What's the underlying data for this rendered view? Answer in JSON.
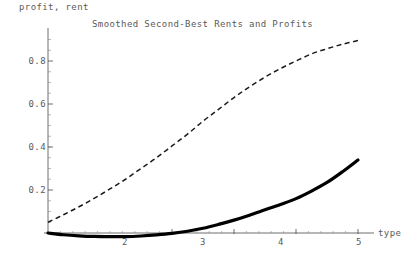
{
  "chart_data": {
    "type": "line",
    "title": "Smoothed Second-Best Rents and Profits",
    "xlabel": "type",
    "ylabel": "profit, rent",
    "xlim": [
      0,
      5.25
    ],
    "ylim": [
      -0.03,
      0.95
    ],
    "grid": false,
    "legend": "none",
    "xticks": [
      "2",
      "3",
      "4",
      "5"
    ],
    "xtick_values": [
      2,
      3,
      4,
      5
    ],
    "yticks": [
      "0.2",
      "0.4",
      "0.6",
      "0.8"
    ],
    "ytick_values": [
      0.2,
      0.4,
      0.6,
      0.8
    ],
    "series": [
      {
        "name": "rent",
        "style": "dashed",
        "color": "#1a1a1a",
        "x": [
          0,
          0.25,
          0.5,
          0.75,
          1.0,
          1.25,
          1.5,
          1.75,
          2.0,
          2.25,
          2.5,
          2.75,
          3.0,
          3.25,
          3.5,
          3.75,
          4.0,
          4.25,
          4.5,
          4.75,
          5.0
        ],
        "values": [
          0.05,
          0.085,
          0.122,
          0.162,
          0.205,
          0.25,
          0.3,
          0.35,
          0.405,
          0.46,
          0.52,
          0.575,
          0.63,
          0.68,
          0.725,
          0.765,
          0.8,
          0.833,
          0.857,
          0.878,
          0.895
        ]
      },
      {
        "name": "profit",
        "style": "solid",
        "color": "#000000",
        "x": [
          0,
          0.25,
          0.5,
          0.75,
          1.0,
          1.25,
          1.5,
          1.75,
          2.0,
          2.25,
          2.5,
          2.75,
          3.0,
          3.25,
          3.5,
          3.75,
          4.0,
          4.25,
          4.5,
          4.75,
          5.0
        ],
        "values": [
          0.0,
          -0.008,
          -0.013,
          -0.016,
          -0.017,
          -0.017,
          -0.014,
          -0.009,
          -0.002,
          0.008,
          0.022,
          0.04,
          0.06,
          0.083,
          0.108,
          0.133,
          0.16,
          0.195,
          0.235,
          0.285,
          0.34
        ]
      }
    ]
  },
  "labels": {
    "title": "Smoothed Second-Best Rents and Profits",
    "ylabel": "profit, rent",
    "xlabel": "type",
    "ytick_0": "0.8",
    "ytick_1": "0.6",
    "ytick_2": "0.4",
    "ytick_3": "0.2",
    "xtick_0": "2",
    "xtick_1": "3",
    "xtick_2": "4",
    "xtick_3": "5"
  }
}
